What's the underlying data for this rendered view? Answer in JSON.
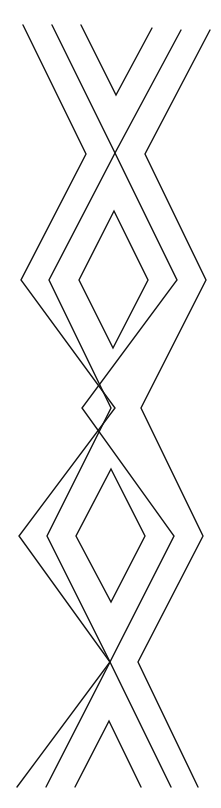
{
  "artwork": {
    "type": "line-art pattern",
    "background": "#ffffff",
    "stroke_color": "#111111",
    "description": "Vertical braided chevron/diamond pattern of black lines on white"
  },
  "strands": {
    "outer_left": "23,25 86,154 21,280 115,408 19,536 110,662 17,787",
    "mid_left": "52,25 115,153 49,280 111,408 47,536 110,662 46,787",
    "outer_right": "210,30 145,154 206,280 141,408 203,536 138,662 198,787",
    "mid_right": "181,30 115,153 177,280 82,408 174,536 110,662 171,787",
    "top_v": "81,25 116,95 152,28",
    "bottom_v": "75,787 109,721 141,787"
  },
  "diamonds": [
    {
      "name": "upper-inner-diamond",
      "points": "114,211 148,280 113,348 79,280"
    },
    {
      "name": "lower-inner-diamond",
      "points": "111,469 145,536 111,602 76,536"
    }
  ]
}
